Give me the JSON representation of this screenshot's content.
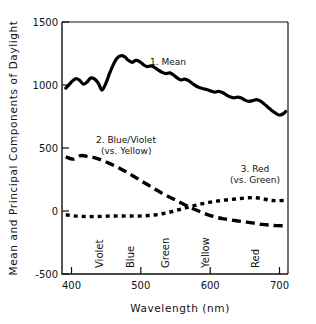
{
  "chart_data": {
    "type": "line",
    "title": "",
    "xlabel": "Wavelength (nm)",
    "ylabel": "Mean and Principal Components of Daylight",
    "xlim": [
      400,
      700
    ],
    "ylim": [
      -500,
      1500
    ],
    "xticks": [
      400,
      500,
      600,
      700
    ],
    "xtick_labels": [
      "400",
      "500",
      "600",
      "700"
    ],
    "yticks": [
      -500,
      0,
      500,
      1000,
      1500
    ],
    "ytick_labels": [
      "-500",
      "0",
      "500",
      "1000",
      "1500"
    ],
    "grid": false,
    "legend_position": "inline-annotations",
    "band_labels": [
      {
        "text": "Violet",
        "wavelength": 420
      },
      {
        "text": "Blue",
        "wavelength": 465
      },
      {
        "text": "Green",
        "wavelength": 515
      },
      {
        "text": "Yellow",
        "wavelength": 572
      },
      {
        "text": "Red",
        "wavelength": 645
      }
    ],
    "annotations": [
      {
        "text": "1. Mean",
        "wavelength": 560,
        "value": 1120
      },
      {
        "text": "2. Blue/Violet",
        "wavelength": 452,
        "value": 560
      },
      {
        "text": "(vs. Yellow)",
        "wavelength": 455,
        "value": 470
      },
      {
        "text": "3. Red",
        "wavelength": 637,
        "value": 375
      },
      {
        "text": "(vs. Green)",
        "wavelength": 640,
        "value": 290
      }
    ],
    "series": [
      {
        "name": "1. Mean",
        "style": "solid",
        "x": [
          405,
          412,
          418,
          423,
          428,
          433,
          438,
          443,
          448,
          453,
          458,
          463,
          468,
          473,
          478,
          483,
          488,
          493,
          498,
          503,
          508,
          513,
          518,
          523,
          528,
          533,
          538,
          543,
          548,
          553,
          558,
          563,
          568,
          573,
          578,
          583,
          588,
          593,
          598,
          603,
          608,
          613,
          618,
          623,
          628,
          633,
          638,
          643,
          648,
          653,
          658,
          663,
          668,
          673,
          678,
          683,
          688,
          693,
          697
        ],
        "values": [
          975,
          1020,
          1050,
          1040,
          1008,
          1022,
          1055,
          1048,
          1016,
          960,
          1010,
          1090,
          1160,
          1212,
          1232,
          1225,
          1196,
          1180,
          1195,
          1186,
          1162,
          1146,
          1152,
          1140,
          1118,
          1100,
          1090,
          1096,
          1080,
          1056,
          1040,
          1046,
          1034,
          1012,
          992,
          978,
          970,
          962,
          952,
          944,
          950,
          940,
          922,
          906,
          898,
          904,
          896,
          880,
          870,
          876,
          884,
          874,
          852,
          826,
          800,
          778,
          762,
          770,
          790
        ]
      },
      {
        "name": "2. Blue/Violet (vs. Yellow)",
        "style": "long-dash",
        "x": [
          405,
          415,
          425,
          435,
          445,
          455,
          465,
          475,
          485,
          495,
          505,
          515,
          525,
          535,
          545,
          555,
          565,
          575,
          585,
          595,
          605,
          615,
          625,
          635,
          645,
          655,
          665,
          675,
          685,
          697
        ],
        "values": [
          430,
          412,
          440,
          430,
          420,
          398,
          372,
          344,
          312,
          276,
          240,
          204,
          168,
          134,
          104,
          74,
          44,
          16,
          -10,
          -32,
          -50,
          -62,
          -72,
          -80,
          -88,
          -96,
          -106,
          -112,
          -116,
          -118
        ]
      },
      {
        "name": "3. Red (vs. Green)",
        "style": "short-dash",
        "x": [
          405,
          415,
          425,
          435,
          445,
          455,
          465,
          475,
          485,
          495,
          505,
          515,
          525,
          535,
          545,
          555,
          565,
          575,
          585,
          595,
          605,
          615,
          625,
          635,
          645,
          655,
          665,
          675,
          685,
          697
        ],
        "values": [
          -30,
          -38,
          -42,
          -44,
          -44,
          -42,
          -40,
          -40,
          -40,
          -40,
          -40,
          -36,
          -30,
          -20,
          -6,
          10,
          26,
          42,
          56,
          68,
          78,
          86,
          92,
          98,
          104,
          106,
          100,
          86,
          82,
          84
        ]
      }
    ]
  }
}
